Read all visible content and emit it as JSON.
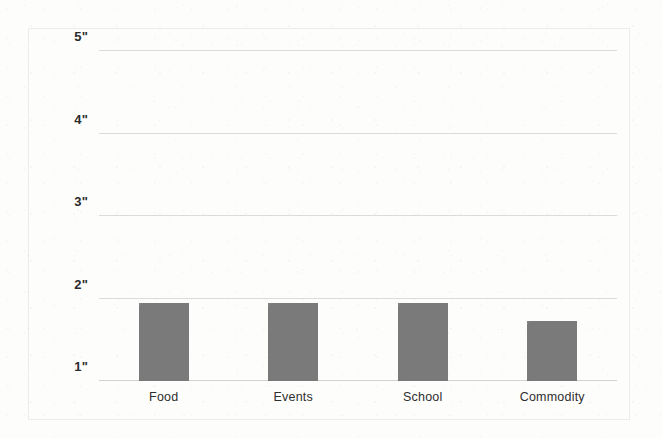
{
  "chart_data": {
    "type": "bar",
    "title": "",
    "subtitle": "",
    "xlabel": "",
    "ylabel": "",
    "categories": [
      "Food",
      "Events",
      "School",
      "Commodity"
    ],
    "values": [
      1.95,
      1.95,
      1.95,
      1.73
    ],
    "ylim": [
      1,
      5
    ],
    "yticks": [
      1,
      2,
      3,
      4,
      5
    ],
    "ytick_labels": [
      "1\"",
      "2\"",
      "3\"",
      "4\"",
      "5\""
    ],
    "grid": true,
    "legend": "none",
    "unit": "inches",
    "bar_color": "#7a7a7a",
    "gridline_color": "#dcdcda",
    "background_color": "#fdfdfc",
    "frame_color": "#ececeb"
  }
}
